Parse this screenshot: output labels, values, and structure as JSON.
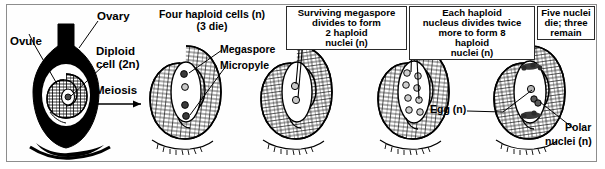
{
  "figure": {
    "background_color": "#ffffff",
    "ink_color": "#000000",
    "frame_color": "#8d8d8d"
  },
  "labels": {
    "ovary": "Ovary",
    "ovule": "Ovule",
    "diploid_cell_line1": "Diploid",
    "diploid_cell_line2": "cell (2n)",
    "meiosis": "Meiosis",
    "megaspore": "Megaspore",
    "micropyle": "Micropyle",
    "egg": "Egg (n)",
    "polar_line1": "Polar",
    "polar_line2": "nuclei (n)"
  },
  "stages": [
    {
      "id": "stage-1-ovary",
      "caption": "",
      "caption_lines": [],
      "boxed": false,
      "nuclei_count": 1,
      "nuclei_note": "Diploid cell (2n) inside ovule within black ovary silhouette"
    },
    {
      "id": "stage-2-four-haploid",
      "caption": "Four haploid cells (n) (3 die)",
      "caption_lines": [
        "Four haploid cells (n)",
        "(3 die)"
      ],
      "boxed": false,
      "nuclei_count": 4,
      "nuclei_note": "Four haploid cells; three degenerate"
    },
    {
      "id": "stage-3-surviving-megaspore",
      "caption": "Surviving megaspore divides to form 2 haploid nuclei (n)",
      "caption_lines": [
        "Surviving megaspore",
        "divides to form",
        "2 haploid",
        "nuclei (n)"
      ],
      "boxed": true,
      "nuclei_count": 2,
      "nuclei_note": "Two haploid nuclei"
    },
    {
      "id": "stage-4-eight-nuclei",
      "caption": "Each haploid nucleus divides twice more to form 8 haploid nuclei (n)",
      "caption_lines": [
        "Each haploid",
        "nucleus divides twice",
        "more to form 8",
        "haploid",
        "nuclei (n)"
      ],
      "boxed": true,
      "nuclei_count": 8,
      "nuclei_note": "Eight haploid nuclei"
    },
    {
      "id": "stage-5-three-remain",
      "caption": "Five nuclei die; three remain",
      "caption_lines": [
        "Five nuclei",
        "die; three",
        "remain"
      ],
      "boxed": true,
      "nuclei_count": 3,
      "nuclei_note": "Egg (n) plus two polar nuclei (n) remain"
    }
  ]
}
